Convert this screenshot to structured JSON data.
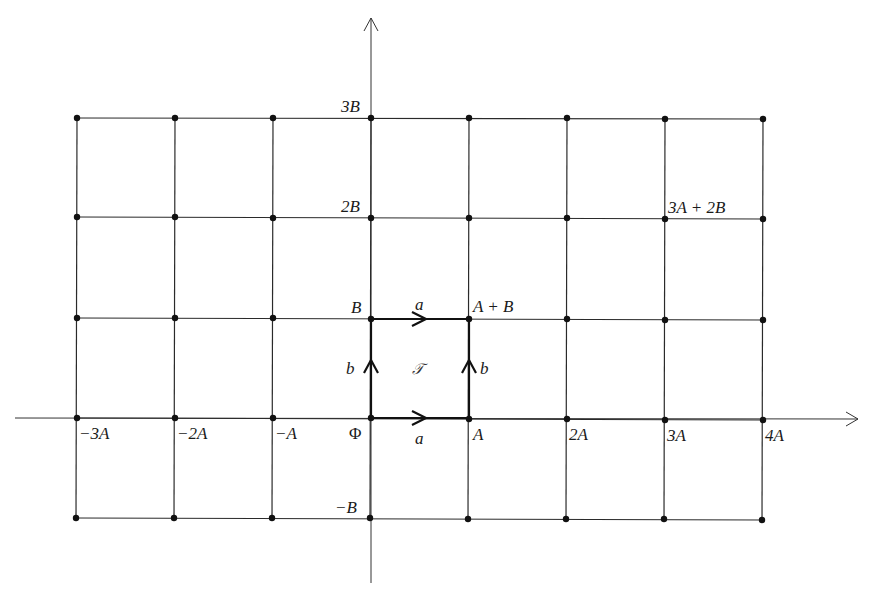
{
  "figure": {
    "type": "lattice-diagram",
    "grid": {
      "columns_multiples_of_A": [
        -3,
        -2,
        -1,
        0,
        1,
        2,
        3,
        4
      ],
      "rows_multiples_of_B": [
        3,
        2,
        1,
        0,
        -1
      ]
    },
    "axis_labels": {
      "x": [
        "−3A",
        "−2A",
        "−A",
        "A",
        "2A",
        "3A",
        "4A"
      ],
      "y": [
        "3B",
        "2B",
        "B",
        "−B"
      ]
    },
    "origin_label": "Φ",
    "point_labels": {
      "a_plus_b": "A + B",
      "three_a_plus_two_b": "3A + 2B"
    },
    "edge_labels": {
      "top": "a",
      "bottom": "a",
      "left": "b",
      "right": "b"
    },
    "region_label": "𝒯",
    "colors": {
      "line": "#2a2a2a",
      "dot": "#111111",
      "background": "#ffffff"
    }
  }
}
